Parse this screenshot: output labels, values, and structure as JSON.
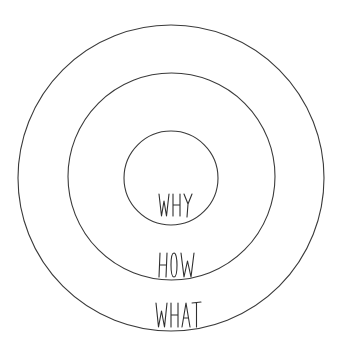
{
  "diagram": {
    "type": "concentric-circles",
    "stroke_color": "#3a3a3a",
    "background": "#ffffff",
    "circles": [
      {
        "name": "outer",
        "cx": 171,
        "cy": 178,
        "r": 153,
        "label": "WHAT"
      },
      {
        "name": "middle",
        "cx": 171.5,
        "cy": 176.5,
        "r": 103.5,
        "label": "HOW"
      },
      {
        "name": "inner",
        "cx": 171,
        "cy": 178,
        "r": 47,
        "label": "WHY"
      }
    ],
    "labels": [
      {
        "text": "WHY",
        "x": 159,
        "y": 193,
        "w": 34,
        "h": 24
      },
      {
        "text": "HOW",
        "x": 159,
        "y": 252,
        "w": 36,
        "h": 26
      },
      {
        "text": "WHAT",
        "x": 156,
        "y": 302,
        "w": 45,
        "h": 26
      }
    ]
  }
}
